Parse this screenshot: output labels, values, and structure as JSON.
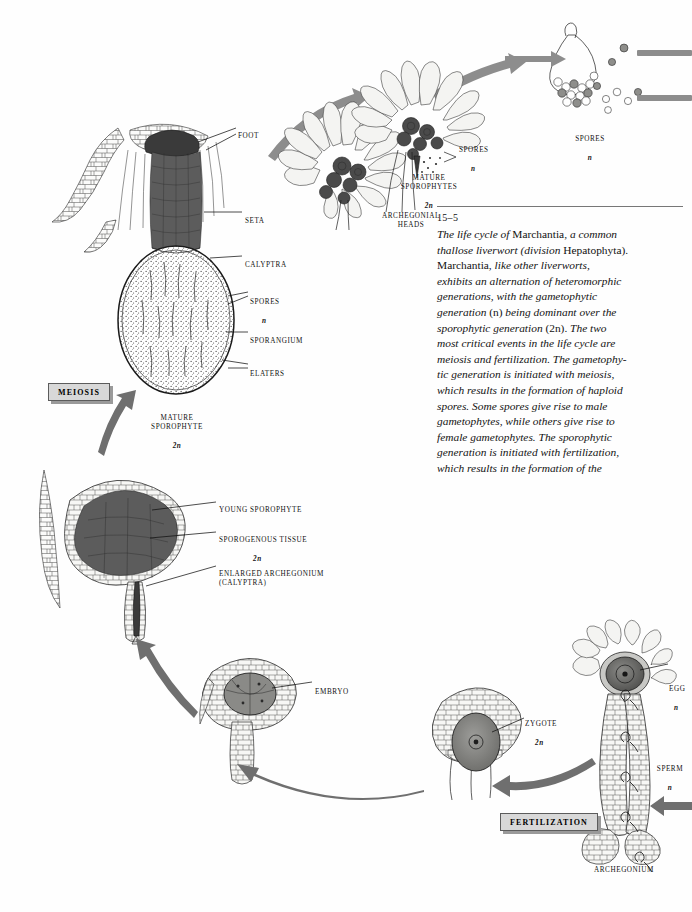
{
  "figure": {
    "number": "15–5",
    "caption_lines": [
      "The life cycle of Marchantia, a common",
      "thallose liverwort (division Hepatophyta).",
      "Marchantia, like other liverworts,",
      "exhibits an alternation of heteromorphic",
      "generations, with the gametophytic",
      "generation (n) being dominant over the",
      "sporophytic generation (2n). The two",
      "most critical events in the life cycle are",
      "meiosis and fertilization. The gametophy-",
      "tic generation is initiated with meiosis,",
      "which results in the formation of haploid",
      "spores. Some spores give rise to male",
      "gametophytes, while others give rise to",
      "female gametophytes. The sporophytic",
      "generation is initiated with fertilization,",
      "which results in the formation of the"
    ]
  },
  "events": {
    "meiosis": "MEIOSIS",
    "fertilization": "FERTILIZATION"
  },
  "labels": {
    "foot": "FOOT",
    "seta": "SETA",
    "calyptra": "CALYPTRA",
    "spores_sporangium": "SPORES",
    "spores_sporangium_n": "n",
    "sporangium": "SPORANGIUM",
    "elaters": "ELATERS",
    "mature_sporophyte": "MATURE\nSPOROPHYTE",
    "mature_sporophyte_n": "2n",
    "archegonial_heads": "ARCHEGONIAL\nHEADS",
    "mature_sporophytes": "MATURE\nSPOROPHYTES",
    "mature_sporophytes_n": "2n",
    "spores_released": "SPORES",
    "spores_released_n": "n",
    "spores_top_right": "SPORES",
    "spores_top_right_n": "n",
    "young_sporophyte": "YOUNG SPOROPHYTE",
    "sporogenous_tissue": "SPOROGENOUS TISSUE",
    "sporogenous_tissue_n": "2n",
    "enlarged_archegonium": "ENLARGED ARCHEGONIUM\n(CALYPTRA)",
    "embryo": "EMBRYO",
    "zygote": "ZYGOTE",
    "zygote_n": "2n",
    "egg": "EGG",
    "egg_n": "n",
    "sperm": "SPERM",
    "sperm_n": "n",
    "archegonium": "ARCHEGONIUM"
  },
  "colors": {
    "arrow": "#8d8d8d",
    "arrow_dark": "#6f6f6f",
    "box_fill": "#d8d8d8",
    "box_border": "#5c5c5c",
    "ink": "#1c1c1c",
    "tissue_dark": "#5c5c5c",
    "cell_light": "#f4f4f2"
  }
}
